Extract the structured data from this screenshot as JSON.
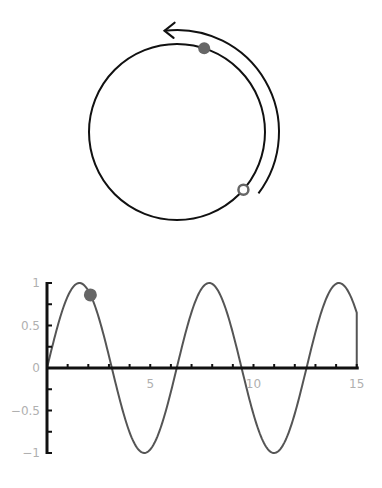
{
  "circle_diagram": {
    "center": [
      177,
      132
    ],
    "radius": 88,
    "arrow_radius": 102,
    "arrow_direction": "counterclockwise",
    "start_point": {
      "type": "open",
      "angle_deg": 41
    },
    "current_point": {
      "type": "filled",
      "angle_deg": -72
    },
    "point_color": "#666666",
    "stroke_color": "#111111"
  },
  "chart_data": {
    "type": "line",
    "title": "",
    "xlabel": "",
    "ylabel": "",
    "function": "sin(x)",
    "xlim": [
      0,
      15
    ],
    "ylim": [
      -1,
      1
    ],
    "x_ticks": [
      "5",
      "10",
      "15"
    ],
    "x_tick_values": [
      5,
      10,
      15
    ],
    "y_ticks": [
      "1",
      "0.5",
      "0",
      "-0.5",
      "-1"
    ],
    "y_tick_values": [
      1,
      0.5,
      0,
      -0.5,
      -1
    ],
    "marker": {
      "x": 2.1,
      "y": 0.86
    },
    "series_color": "#555555",
    "grid": false
  }
}
